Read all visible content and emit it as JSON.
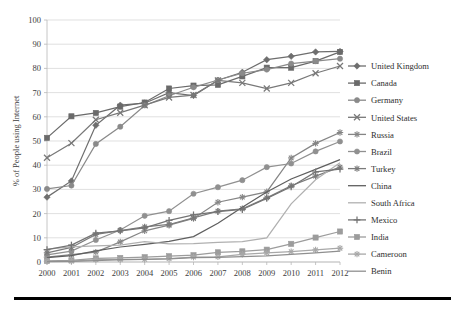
{
  "chart_data": {
    "type": "line",
    "title": "",
    "xlabel": "",
    "ylabel": "% of People using Internet",
    "xlim": [
      2000,
      2012
    ],
    "ylim": [
      0,
      100
    ],
    "grid": true,
    "legend_position": "right",
    "categories": [
      "2000",
      "2001",
      "2002",
      "2003",
      "2004",
      "2005",
      "2006",
      "2007",
      "2008",
      "2009",
      "2010",
      "2011",
      "2012"
    ],
    "x": [
      2000,
      2001,
      2002,
      2003,
      2004,
      2005,
      2006,
      2007,
      2008,
      2009,
      2010,
      2011,
      2012
    ],
    "ytick_labels": [
      "0",
      "10",
      "20",
      "30",
      "40",
      "50",
      "60",
      "70",
      "80",
      "90",
      "100"
    ],
    "ytick_values": [
      0,
      10,
      20,
      30,
      40,
      50,
      60,
      70,
      80,
      90,
      100
    ],
    "series": [
      {
        "name": "United Kingdom",
        "marker": "diamond",
        "color": "#6e6e6e",
        "values": [
          26.8,
          33.5,
          56.5,
          64.8,
          65.6,
          70.0,
          68.8,
          75.1,
          78.4,
          83.6,
          85.0,
          86.8,
          87.0
        ]
      },
      {
        "name": "Canada",
        "marker": "square",
        "color": "#6a6a6a",
        "values": [
          51.3,
          60.2,
          61.6,
          64.2,
          65.9,
          71.7,
          72.9,
          73.2,
          76.7,
          80.3,
          80.3,
          83.0,
          86.8
        ]
      },
      {
        "name": "Germany",
        "marker": "circle",
        "color": "#8a8a8a",
        "values": [
          30.2,
          31.6,
          48.8,
          55.9,
          64.7,
          68.7,
          72.2,
          75.2,
          78.0,
          79.5,
          82.0,
          83.0,
          84.0
        ]
      },
      {
        "name": "United States",
        "marker": "cross",
        "color": "#787878",
        "values": [
          43.1,
          49.1,
          58.8,
          61.7,
          64.8,
          68.0,
          69.0,
          75.0,
          74.0,
          71.7,
          74.0,
          78.0,
          81.0
        ]
      },
      {
        "name": "Russia",
        "marker": "star",
        "color": "#858585",
        "values": [
          2.0,
          3.0,
          4.1,
          8.3,
          12.9,
          15.2,
          18.0,
          24.7,
          26.8,
          29.0,
          43.0,
          49.0,
          53.5
        ]
      },
      {
        "name": "Brazil",
        "marker": "circle",
        "color": "#909090",
        "values": [
          2.9,
          4.5,
          9.1,
          13.2,
          19.1,
          21.0,
          28.2,
          30.9,
          33.8,
          39.2,
          40.7,
          45.7,
          49.8
        ]
      },
      {
        "name": "Turkey",
        "marker": "star",
        "color": "#7b7b7b",
        "values": [
          3.8,
          6.0,
          11.4,
          13.0,
          14.5,
          15.5,
          18.2,
          21.0,
          22.0,
          26.5,
          31.5,
          35.5,
          39.2
        ]
      },
      {
        "name": "China",
        "marker": "line",
        "color": "#5f5f5f",
        "values": [
          1.8,
          2.6,
          4.6,
          6.2,
          7.3,
          8.5,
          10.5,
          16.0,
          22.6,
          28.9,
          34.3,
          38.3,
          42.3
        ]
      },
      {
        "name": "South Africa",
        "marker": "line",
        "color": "#b0b0b0",
        "values": [
          5.3,
          6.3,
          6.7,
          7.0,
          8.4,
          7.5,
          7.6,
          8.1,
          8.4,
          10.0,
          24.0,
          34.0,
          41.0
        ]
      },
      {
        "name": "Mexico",
        "marker": "plus",
        "color": "#747474",
        "values": [
          5.1,
          7.0,
          11.9,
          12.9,
          14.1,
          17.2,
          19.5,
          20.8,
          21.7,
          26.3,
          31.1,
          37.2,
          38.4
        ]
      },
      {
        "name": "India",
        "marker": "square",
        "color": "#9c9c9c",
        "values": [
          0.5,
          0.7,
          1.5,
          1.7,
          2.0,
          2.4,
          2.8,
          4.0,
          4.4,
          5.1,
          7.5,
          10.1,
          12.6
        ]
      },
      {
        "name": "Cameroon",
        "marker": "star",
        "color": "#a8a8a8",
        "values": [
          0.3,
          0.4,
          1.0,
          1.0,
          1.1,
          1.4,
          2.0,
          2.1,
          3.2,
          3.8,
          4.3,
          5.0,
          5.7
        ]
      },
      {
        "name": "Benin",
        "marker": "line",
        "color": "#8f8f8f",
        "values": [
          0.2,
          0.3,
          0.6,
          1.0,
          1.1,
          1.3,
          1.8,
          1.9,
          2.2,
          2.5,
          3.1,
          3.8,
          4.5
        ]
      }
    ]
  }
}
